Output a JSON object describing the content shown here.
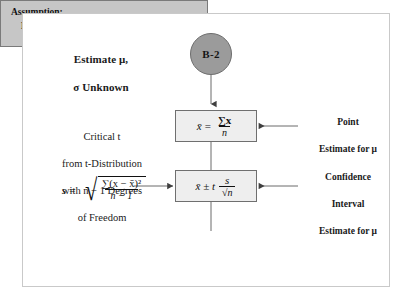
{
  "diagram": {
    "title_block": {
      "line1": "Estimate μ,",
      "line2": "σ Unknown"
    },
    "circle_node": {
      "label": "B-2",
      "fill_color": "#9b9b9b",
      "stroke_color": "#6d6d6d"
    },
    "point_estimate_box": {
      "lhs": "x̄",
      "equals": "=",
      "numerator": "∑x",
      "denominator": "n",
      "formula_text": "x̄ = ∑x / n",
      "fill_color": "#eeeeee"
    },
    "confidence_interval_box": {
      "lhs": "x̄ ± t",
      "numerator": "s",
      "denominator": "√n",
      "formula_text": "x̄ ± t s/√n",
      "fill_color": "#eeeeee"
    },
    "critical_t_block": {
      "line1": "Critical t",
      "line2": "from t-Distribution",
      "line3": "with n − 1 Degrees",
      "line4": "of Freedom"
    },
    "s_formula": {
      "lhs": "s",
      "equals": "=",
      "numerator": "∑(x − x̄)²",
      "denominator": "n − 1",
      "formula_text": "s = √( ∑(x − x̄)² / (n − 1) )"
    },
    "point_label": {
      "line1": "Point",
      "line2": "Estimate for μ"
    },
    "confidence_label": {
      "line1": "Confidence",
      "line2": "Interval",
      "line3": "Estimate for μ"
    },
    "assumption_box": {
      "line1": "Assumption:",
      "line2": "Population Is Normally Distributed.",
      "fill_color": "#c6c6c6"
    },
    "frame": {
      "border_color": "#c9c9c9"
    },
    "connector_color": "#4a4a4a"
  }
}
